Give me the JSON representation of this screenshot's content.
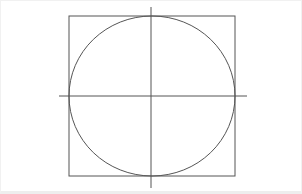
{
  "diagram": {
    "colors": {
      "stroke": "#555555",
      "background": "#ffffff"
    },
    "square": {
      "x": 68,
      "y": 15,
      "width": 166,
      "height": 160
    },
    "circle": {
      "cx": 151,
      "cy": 95,
      "rx": 83,
      "ry": 80
    },
    "vertical_axis": {
      "x": 150,
      "y1": 6,
      "y2": 187
    },
    "horizontal_axis": {
      "y": 95,
      "x1": 58,
      "x2": 246
    }
  }
}
